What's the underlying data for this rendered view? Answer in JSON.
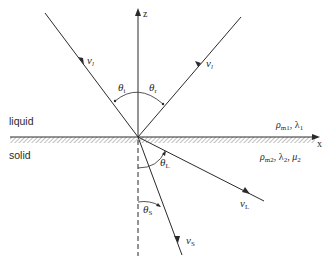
{
  "diagram": {
    "title": "",
    "axes": {
      "z_label": "z",
      "x_label": "x"
    },
    "media": {
      "upper": {
        "name": "liquid",
        "properties": {
          "rho": "ρ",
          "rho_sub": "m1",
          "sep": ", ",
          "lambda": "λ",
          "lambda_sub": "1"
        }
      },
      "lower": {
        "name": "solid",
        "properties": {
          "rho": "ρ",
          "rho_sub": "m2",
          "sep1": ", ",
          "lambda": "λ",
          "lambda_sub": "2",
          "sep2": ", ",
          "mu": "μ",
          "mu_sub": "2"
        }
      }
    },
    "rays": {
      "incident": {
        "label": "v",
        "sub": "l"
      },
      "reflected": {
        "label": "v",
        "sub": "l"
      },
      "longitudinal": {
        "label": "v",
        "sub": "L"
      },
      "shear": {
        "label": "v",
        "sub": "S"
      }
    },
    "angles": {
      "incident": {
        "symbol": "θ",
        "sub": "i"
      },
      "reflected": {
        "symbol": "θ",
        "sub": "r"
      },
      "longitudinal": {
        "symbol": "θ",
        "sub": "L"
      },
      "shear": {
        "symbol": "θ",
        "sub": "S"
      }
    },
    "colors": {
      "line": "#2a2a2a",
      "hatch": "#8a8a8a",
      "background": "#ffffff"
    }
  }
}
